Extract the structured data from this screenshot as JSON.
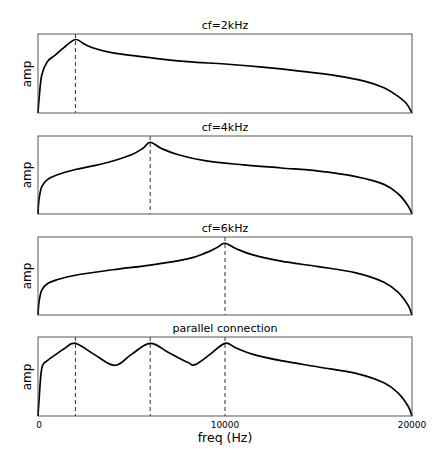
{
  "chart_data": {
    "type": "line",
    "layout": "4 vertically stacked subplots, shared x-axis",
    "xlabel": "freq (Hz)",
    "xlim": [
      0,
      20000
    ],
    "xticks": [
      0,
      10000,
      20000
    ],
    "xtick_labels": [
      "0",
      "10000",
      "20000"
    ],
    "grid": false,
    "legend": null,
    "subplots": [
      {
        "title": "cf=2kHz",
        "ylabel": "amp",
        "vlines": [
          2000
        ],
        "series": [
          {
            "name": "response",
            "x": [
              0,
              50,
              200,
              500,
              900,
              1400,
              2000,
              2500,
              3000,
              4000,
              6000,
              8000,
              10000,
              12000,
              14000,
              16000,
              17500,
              18500,
              19200,
              19700,
              20000
            ],
            "y": [
              0.0,
              0.16,
              0.48,
              0.65,
              0.73,
              0.83,
              0.93,
              0.87,
              0.82,
              0.76,
              0.7,
              0.65,
              0.62,
              0.58,
              0.53,
              0.47,
              0.4,
              0.32,
              0.22,
              0.12,
              0.0
            ]
          }
        ]
      },
      {
        "title": "cf=4kHz",
        "ylabel": "amp",
        "vlines": [
          6000
        ],
        "series": [
          {
            "name": "response",
            "x": [
              0,
              50,
              200,
              500,
              1000,
              2000,
              3000,
              4000,
              5000,
              5600,
              6000,
              6600,
              7500,
              9000,
              11000,
              13000,
              15000,
              17000,
              18500,
              19300,
              19800,
              20000
            ],
            "y": [
              0.0,
              0.18,
              0.35,
              0.44,
              0.5,
              0.57,
              0.62,
              0.68,
              0.76,
              0.84,
              0.92,
              0.84,
              0.76,
              0.68,
              0.63,
              0.59,
              0.55,
              0.48,
              0.38,
              0.25,
              0.1,
              0.0
            ]
          }
        ]
      },
      {
        "title": "cf=6kHz",
        "ylabel": "amp",
        "vlines": [
          10000
        ],
        "series": [
          {
            "name": "response",
            "x": [
              0,
              50,
              200,
              500,
              1000,
              2000,
              4000,
              6000,
              8000,
              9000,
              9600,
              10000,
              10600,
              11500,
              13000,
              15000,
              17000,
              18500,
              19300,
              19800,
              20000
            ],
            "y": [
              0.0,
              0.16,
              0.32,
              0.4,
              0.45,
              0.51,
              0.58,
              0.64,
              0.72,
              0.8,
              0.87,
              0.92,
              0.85,
              0.77,
              0.69,
              0.62,
              0.54,
              0.42,
              0.28,
              0.12,
              0.0
            ]
          }
        ]
      },
      {
        "title": "parallel connection",
        "ylabel": "amp",
        "vlines": [
          2000,
          6000,
          10000
        ],
        "series": [
          {
            "name": "response",
            "x": [
              0,
              50,
              200,
              500,
              900,
              1400,
              2000,
              3000,
              4100,
              5000,
              6000,
              7000,
              8000,
              8400,
              9200,
              10000,
              10600,
              11500,
              13000,
              15000,
              17000,
              18500,
              19300,
              19800,
              20000
            ],
            "y": [
              0.0,
              0.18,
              0.6,
              0.7,
              0.77,
              0.85,
              0.92,
              0.78,
              0.64,
              0.78,
              0.92,
              0.8,
              0.68,
              0.65,
              0.78,
              0.92,
              0.86,
              0.78,
              0.7,
              0.62,
              0.54,
              0.42,
              0.28,
              0.12,
              0.0
            ]
          }
        ]
      }
    ]
  }
}
